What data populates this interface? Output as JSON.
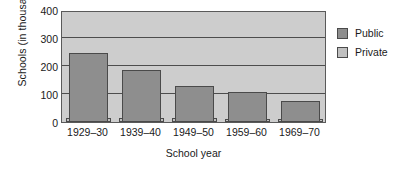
{
  "chart_data": {
    "type": "bar",
    "title": "",
    "subtitle": "",
    "xlabel": "School year",
    "ylabel": "Schools (in thousands)",
    "categories": [
      "1929–30",
      "1939–40",
      "1949–50",
      "1959–60",
      "1969–70"
    ],
    "series": [
      {
        "name": "Public",
        "color": "#8e8e8e",
        "values": [
          245,
          185,
          130,
          108,
          75
        ]
      },
      {
        "name": "Private",
        "color": "#c0c0c0",
        "values": [
          15,
          14,
          13,
          12,
          11
        ]
      }
    ],
    "ylim": [
      0,
      400
    ],
    "yticks": [
      0,
      100,
      200,
      300,
      400
    ],
    "ytick_labels": [
      "0",
      "100",
      "200",
      "300",
      "400"
    ],
    "grid": true,
    "grid_axis": "y",
    "legend_position": "right",
    "plot_background": "#cdcdcd",
    "axis_color": "#4d4d4d",
    "bar_overlap": "private-behind-public"
  },
  "legend": {
    "items": [
      {
        "label": "Public",
        "color": "#8e8e8e"
      },
      {
        "label": "Private",
        "color": "#c0c0c0"
      }
    ]
  }
}
